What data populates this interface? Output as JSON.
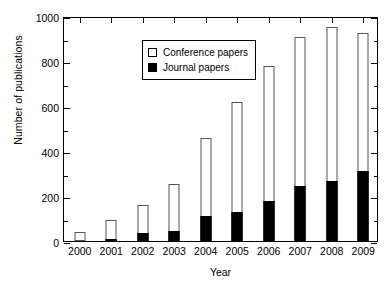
{
  "chart_data": {
    "type": "bar",
    "stacked": true,
    "title": "",
    "xlabel": "Year",
    "ylabel": "Number of publications",
    "categories": [
      "2000",
      "2001",
      "2002",
      "2003",
      "2004",
      "2005",
      "2006",
      "2007",
      "2008",
      "2009"
    ],
    "series": [
      {
        "name": "Journal papers",
        "color": "#000000",
        "fill": "solid",
        "values": [
          0,
          10,
          35,
          45,
          110,
          130,
          180,
          245,
          265,
          310
        ]
      },
      {
        "name": "Conference papers",
        "color": "#ffffff",
        "fill": "open",
        "values": [
          40,
          85,
          125,
          210,
          350,
          490,
          600,
          660,
          685,
          615
        ]
      }
    ],
    "totals": [
      40,
      95,
      160,
      255,
      460,
      620,
      780,
      905,
      950,
      925
    ],
    "ylim": [
      0,
      1000
    ],
    "yticks": [
      0,
      200,
      400,
      600,
      800,
      1000
    ],
    "yticks_minor": [
      100,
      300,
      500,
      700,
      900
    ],
    "ytick_labels": [
      "0",
      "200",
      "400",
      "600",
      "800",
      "1000"
    ],
    "grid": false,
    "legend_position": "top-left",
    "legend": [
      {
        "label": "Conference papers",
        "swatch": "open"
      },
      {
        "label": "Journal papers",
        "swatch": "filled"
      }
    ]
  }
}
